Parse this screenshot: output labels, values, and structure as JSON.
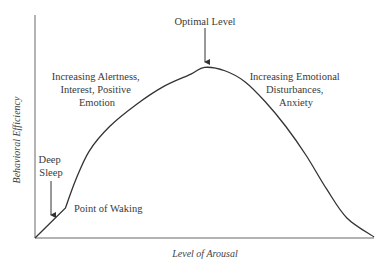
{
  "diagram": {
    "x_axis_label": "Level of Arousal",
    "y_axis_label": "Behavioral Efficiency",
    "annotations": {
      "optimal": "Optimal Level",
      "left_region": [
        "Increasing Alertness,",
        "Interest, Positive",
        "Emotion"
      ],
      "right_region": [
        "Increasing Emotional",
        "Disturbances,",
        "Anxiety"
      ],
      "deep_sleep": [
        "Deep",
        "Sleep"
      ],
      "waking": "Point of Waking"
    },
    "colors": {
      "axis": "#9a9a9a",
      "curve": "#333333",
      "text": "#3a3a3a"
    }
  },
  "chart_data": {
    "type": "line",
    "title": "",
    "xlabel": "Level of Arousal",
    "ylabel": "Behavioral Efficiency",
    "xlim": [
      0,
      100
    ],
    "ylim": [
      0,
      100
    ],
    "grid": false,
    "series": [
      {
        "name": "Behavioral Efficiency",
        "points": [
          [
            0,
            0
          ],
          [
            9,
            13.5
          ],
          [
            12,
            26
          ],
          [
            16,
            39
          ],
          [
            22,
            50
          ],
          [
            30,
            60
          ],
          [
            38,
            68
          ],
          [
            46,
            73.5
          ],
          [
            50,
            76.5
          ],
          [
            56,
            75
          ],
          [
            62,
            70
          ],
          [
            68,
            61
          ],
          [
            74,
            50
          ],
          [
            80,
            37
          ],
          [
            86,
            22
          ],
          [
            92,
            9
          ],
          [
            100,
            0.5
          ]
        ]
      }
    ],
    "annotations": [
      {
        "text": "Optimal Level",
        "x": 50,
        "y": 76.5,
        "arrow": true
      },
      {
        "text": "Point of Waking",
        "x": 9,
        "y": 13.5,
        "arrow": false
      },
      {
        "text": "Deep Sleep",
        "x": 5,
        "y": 7,
        "arrow": true
      },
      {
        "text": "Increasing Alertness, Interest, Positive Emotion",
        "region": "left"
      },
      {
        "text": "Increasing Emotional Disturbances, Anxiety",
        "region": "right"
      }
    ]
  }
}
